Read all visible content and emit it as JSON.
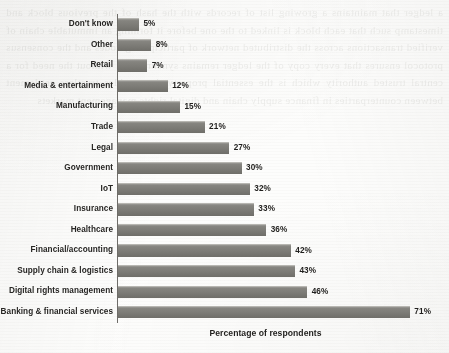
{
  "chart_data": {
    "type": "bar",
    "orientation": "horizontal",
    "title": "",
    "xlabel": "Percentage of respondents",
    "ylabel": "",
    "xlim": [
      0,
      75
    ],
    "grid": false,
    "legend": null,
    "value_suffix": "%",
    "categories": [
      "Don't know",
      "Other",
      "Retail",
      "Media & entertainment",
      "Manufacturing",
      "Trade",
      "Legal",
      "Government",
      "IoT",
      "Insurance",
      "Healthcare",
      "Financial/accounting",
      "Supply chain & logistics",
      "Digital rights management",
      "Banking & financial services"
    ],
    "values": [
      5,
      8,
      7,
      12,
      15,
      21,
      27,
      30,
      32,
      33,
      36,
      42,
      43,
      46,
      71
    ],
    "value_labels": [
      "5%",
      "8%",
      "7%",
      "12%",
      "15%",
      "21%",
      "27%",
      "30%",
      "32%",
      "33%",
      "36%",
      "42%",
      "43%",
      "46%",
      "71%"
    ],
    "colors": {
      "bar_fill": "#7c7b76",
      "bar_highlight": "#9a9995",
      "axis": "#6e6c68",
      "text": "#201f1d",
      "background": "#fdfdfc"
    }
  },
  "ghost": {
    "bleed_text": "a ledger that maintains a growing list of records with the hash of the previous block and timestamp such that each block is linked to the one before it forming an immutable chain of verified transactions across the distributed network of participating nodes and the consensus protocol ensures that every copy of the ledger remains synchronized without the need for a central trusted authority which is the essential property that enables trustless settlement between counterparties in finance supply chain and digital rights management markets"
  }
}
